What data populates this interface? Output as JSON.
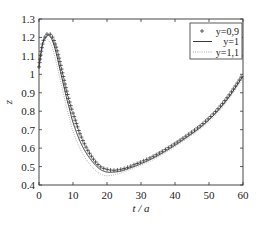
{
  "chart_data": {
    "type": "line",
    "title": "",
    "xlabel": "t / a",
    "ylabel": "z",
    "xlim": [
      0,
      60
    ],
    "ylim": [
      0.4,
      1.3
    ],
    "xticks": [
      0,
      10,
      20,
      30,
      40,
      50,
      60
    ],
    "yticks": [
      0.4,
      0.5,
      0.6,
      0.7,
      0.8,
      0.9,
      1,
      1.1,
      1.2,
      1.3
    ],
    "xtick_labels": [
      "0",
      "10",
      "20",
      "30",
      "40",
      "50",
      "60"
    ],
    "ytick_labels": [
      "0.4",
      "0.5",
      "0.6",
      "0.7",
      "0.8",
      "0.9",
      "1",
      "1.1",
      "1.2",
      "1.3"
    ],
    "grid": false,
    "legend_position": "upper right",
    "x": [
      0,
      1,
      2,
      3,
      4,
      5,
      6,
      7,
      8,
      9,
      10,
      12,
      14,
      16,
      18,
      20,
      22,
      24,
      26,
      28,
      30,
      33,
      36,
      40,
      44,
      48,
      52,
      56,
      60
    ],
    "series": [
      {
        "name": "y=0,9",
        "style": "plus-markers",
        "values": [
          1.04,
          1.16,
          1.21,
          1.22,
          1.2,
          1.15,
          1.08,
          1.0,
          0.92,
          0.85,
          0.79,
          0.68,
          0.6,
          0.54,
          0.5,
          0.485,
          0.48,
          0.485,
          0.495,
          0.51,
          0.525,
          0.55,
          0.58,
          0.625,
          0.675,
          0.73,
          0.8,
          0.89,
          1.0
        ]
      },
      {
        "name": "y=1",
        "style": "solid",
        "values": [
          1.04,
          1.16,
          1.2,
          1.21,
          1.18,
          1.12,
          1.04,
          0.96,
          0.88,
          0.81,
          0.74,
          0.64,
          0.57,
          0.52,
          0.485,
          0.47,
          0.47,
          0.475,
          0.487,
          0.5,
          0.515,
          0.54,
          0.57,
          0.615,
          0.665,
          0.72,
          0.79,
          0.88,
          0.99
        ]
      },
      {
        "name": "y=1,1",
        "style": "dotted",
        "values": [
          1.04,
          1.15,
          1.19,
          1.18,
          1.14,
          1.07,
          0.99,
          0.91,
          0.83,
          0.76,
          0.69,
          0.6,
          0.535,
          0.49,
          0.46,
          0.45,
          0.455,
          0.465,
          0.478,
          0.492,
          0.507,
          0.532,
          0.562,
          0.607,
          0.657,
          0.712,
          0.78,
          0.87,
          0.98
        ]
      }
    ]
  },
  "legend": {
    "items": [
      {
        "symbol": "+",
        "label": "y=0,9"
      },
      {
        "symbol": "—",
        "label": "y=1"
      },
      {
        "symbol": "····",
        "label": "y=1,1"
      }
    ]
  },
  "axes": {
    "xlabel": "t / a",
    "ylabel": "z"
  }
}
